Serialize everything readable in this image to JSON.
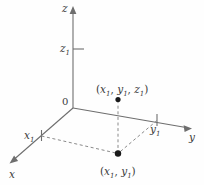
{
  "figure": {
    "type": "3d-coordinate-axes-diagram",
    "background_color": "#fefefe",
    "line_color": "#6e6e6e",
    "dot_color": "#1a1a1a",
    "axes": {
      "z": {
        "label": "z",
        "subscript": "",
        "arrow": "up"
      },
      "y": {
        "label": "y",
        "subscript": "",
        "arrow": "right-down"
      },
      "x": {
        "label": "x",
        "subscript": "",
        "arrow": "left-down"
      }
    },
    "tick_labels": {
      "z1_base": "z",
      "z1_sub": "1",
      "x1_base": "x",
      "x1_sub": "1",
      "y1_base": "y",
      "y1_sub": "1"
    },
    "origin_label": "0",
    "point_3d": {
      "open_paren": "(",
      "x_base": "x",
      "x_sub": "1",
      "comma1": ", ",
      "y_base": "y",
      "y_sub": "1",
      "comma2": ", ",
      "z_base": "z",
      "z_sub": "1",
      "close_paren": ")"
    },
    "point_2d": {
      "open_paren": "(",
      "x_base": "x",
      "x_sub": "1",
      "comma1": ", ",
      "y_base": "y",
      "y_sub": "1",
      "close_paren": ")"
    }
  }
}
